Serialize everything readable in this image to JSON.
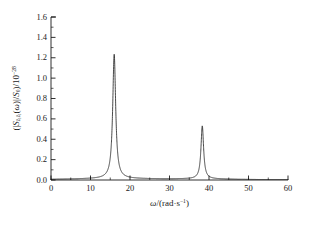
{
  "chart_data": {
    "type": "line",
    "title": "",
    "xlabel": "ω/(rad·s⁻¹)",
    "ylabel": "(|Sẍ₁ẍ₁(ω)|/S₀)/10⁻²⁸",
    "xlim": [
      0,
      60
    ],
    "ylim": [
      0,
      1.6
    ],
    "xticks": [
      0,
      10,
      20,
      30,
      40,
      50,
      60
    ],
    "xtick_labels": [
      "0",
      "10",
      "20",
      "30",
      "40",
      "50",
      "60"
    ],
    "yticks": [
      0.0,
      0.2,
      0.4,
      0.6,
      0.8,
      1.0,
      1.2,
      1.4,
      1.6
    ],
    "ytick_labels": [
      "0.0",
      "0.2",
      "0.4",
      "0.6",
      "0.8",
      "1.0",
      "1.2",
      "1.4",
      "1.6"
    ],
    "minor_ticks": true,
    "grid": false,
    "legend": null,
    "line_color": "#1a1a1a",
    "line_width": 0.8,
    "peaks": [
      {
        "x": 16.0,
        "y": 1.22,
        "width": 0.45
      },
      {
        "x": 38.3,
        "y": 0.52,
        "width": 0.4
      }
    ],
    "baseline": 0.0,
    "series": [
      {
        "name": "|S_z1z1(ω)|/S0",
        "x": [
          0,
          1,
          2,
          3,
          4,
          5,
          6,
          7,
          8,
          9,
          10,
          11,
          12,
          13,
          14,
          14.5,
          15,
          15.3,
          15.6,
          15.8,
          15.9,
          16.0,
          16.1,
          16.2,
          16.4,
          16.7,
          17,
          17.5,
          18,
          19,
          20,
          22,
          24,
          26,
          28,
          30,
          32,
          34,
          35,
          36,
          37,
          37.5,
          37.9,
          38.1,
          38.3,
          38.5,
          38.7,
          39,
          39.5,
          40,
          41,
          42,
          44,
          46,
          48,
          50,
          52,
          54,
          56,
          58,
          60
        ],
        "y": [
          0.0,
          0.001,
          0.002,
          0.003,
          0.004,
          0.006,
          0.008,
          0.011,
          0.015,
          0.022,
          0.032,
          0.046,
          0.068,
          0.105,
          0.185,
          0.26,
          0.45,
          0.66,
          0.96,
          1.16,
          1.21,
          1.22,
          1.2,
          1.12,
          0.8,
          0.46,
          0.3,
          0.18,
          0.12,
          0.07,
          0.048,
          0.03,
          0.023,
          0.021,
          0.022,
          0.025,
          0.031,
          0.045,
          0.057,
          0.078,
          0.125,
          0.18,
          0.33,
          0.45,
          0.52,
          0.47,
          0.36,
          0.22,
          0.12,
          0.078,
          0.045,
          0.031,
          0.02,
          0.014,
          0.011,
          0.009,
          0.007,
          0.006,
          0.005,
          0.004,
          0.003
        ]
      }
    ]
  },
  "axes": {
    "y_label_text": "(|S",
    "y_label_sub1": "ẍ₁ẍ₁",
    "y_label_mid": "(ω)|/S",
    "y_label_sub2": "0",
    "y_label_tail": ")/10",
    "y_label_exp": "−28",
    "x_label_sym": "ω",
    "x_label_unit": "/(rad·s",
    "x_label_exp": "−1",
    "x_label_close": ")"
  }
}
